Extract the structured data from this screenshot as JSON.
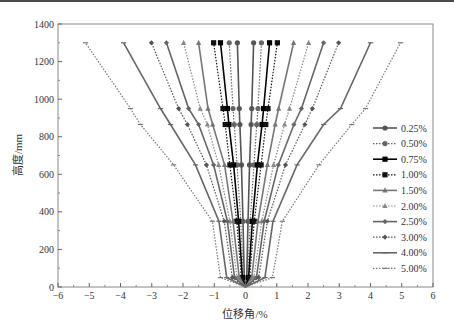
{
  "chart_data": {
    "type": "line",
    "title": "",
    "xlabel": "位移角/%",
    "ylabel": "高度/mm",
    "xlim": [
      -6,
      6
    ],
    "ylim": [
      0,
      1400
    ],
    "xticks": [
      -6,
      -5,
      -4,
      -3,
      -2,
      -1,
      0,
      1,
      2,
      3,
      4,
      5,
      6
    ],
    "yticks": [
      0,
      200,
      400,
      600,
      800,
      1000,
      1200,
      1400
    ],
    "grid": false,
    "legend_position": "right",
    "heights": [
      0,
      50,
      350,
      650,
      865,
      950,
      1300
    ],
    "series": [
      {
        "name": "0.25%",
        "style": "solid",
        "marker": "circle",
        "color": "#555555",
        "neg": [
          0,
          -0.04,
          -0.08,
          -0.13,
          -0.18,
          -0.2,
          -0.26
        ],
        "pos": [
          0,
          0.04,
          0.08,
          0.13,
          0.18,
          0.2,
          0.26
        ]
      },
      {
        "name": "0.50%",
        "style": "dotted",
        "marker": "circle",
        "color": "#666666",
        "neg": [
          0,
          -0.07,
          -0.15,
          -0.27,
          -0.36,
          -0.4,
          -0.52
        ],
        "pos": [
          0,
          0.07,
          0.15,
          0.27,
          0.36,
          0.4,
          0.51
        ]
      },
      {
        "name": "0.75%",
        "style": "solid",
        "marker": "square",
        "color": "#000000",
        "neg": [
          0,
          -0.1,
          -0.22,
          -0.38,
          -0.53,
          -0.58,
          -0.8
        ],
        "pos": [
          0,
          0.1,
          0.22,
          0.38,
          0.53,
          0.58,
          0.77
        ]
      },
      {
        "name": "1.00%",
        "style": "dotted",
        "marker": "square",
        "color": "#111111",
        "neg": [
          0,
          -0.13,
          -0.28,
          -0.5,
          -0.65,
          -0.72,
          -1.02
        ],
        "pos": [
          0,
          0.13,
          0.28,
          0.5,
          0.65,
          0.72,
          1.02
        ]
      },
      {
        "name": "1.50%",
        "style": "solid",
        "marker": "triangle",
        "color": "#777777",
        "neg": [
          0,
          -0.2,
          -0.4,
          -0.67,
          -1.05,
          -1.2,
          -1.5
        ],
        "pos": [
          0,
          0.2,
          0.4,
          0.7,
          0.95,
          1.06,
          1.54
        ]
      },
      {
        "name": "2.00%",
        "style": "dotted",
        "marker": "triangle",
        "color": "#888888",
        "neg": [
          0,
          -0.27,
          -0.5,
          -0.86,
          -1.22,
          -1.45,
          -1.98
        ],
        "pos": [
          0,
          0.27,
          0.52,
          0.9,
          1.25,
          1.41,
          2.02
        ]
      },
      {
        "name": "2.50%",
        "style": "solid",
        "marker": "diamond",
        "color": "#666666",
        "neg": [
          0,
          -0.35,
          -0.58,
          -1.02,
          -1.5,
          -1.82,
          -2.53
        ],
        "pos": [
          0,
          0.35,
          0.6,
          1.05,
          1.55,
          1.79,
          2.5
        ]
      },
      {
        "name": "3.00%",
        "style": "dotted",
        "marker": "diamond",
        "color": "#555555",
        "neg": [
          0,
          -0.42,
          -0.68,
          -1.25,
          -1.86,
          -2.14,
          -3.01
        ],
        "pos": [
          0,
          0.42,
          0.7,
          1.28,
          1.9,
          2.14,
          2.98
        ]
      },
      {
        "name": "4.00%",
        "style": "solid",
        "marker": "dash",
        "color": "#666666",
        "neg": [
          0,
          -0.6,
          -0.85,
          -1.6,
          -2.4,
          -2.72,
          -3.9
        ],
        "pos": [
          0,
          0.62,
          0.88,
          1.65,
          2.5,
          3.04,
          4.0
        ]
      },
      {
        "name": "5.00%",
        "style": "dotted",
        "marker": "dash",
        "color": "#777777",
        "neg": [
          0,
          -0.8,
          -1.06,
          -2.3,
          -3.36,
          -3.68,
          -5.12
        ],
        "pos": [
          0,
          0.86,
          1.18,
          2.35,
          3.4,
          3.84,
          4.96
        ]
      }
    ]
  }
}
